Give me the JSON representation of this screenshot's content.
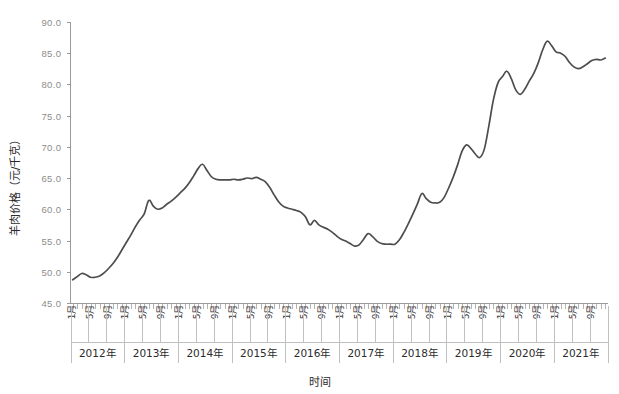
{
  "chart_data": {
    "type": "line",
    "title": "",
    "xlabel": "时间",
    "ylabel": "羊肉价格（元/千克）",
    "ylim": [
      45.0,
      90.0
    ],
    "ytick_step": 5.0,
    "ytick_labels": [
      "45.0",
      "50.0",
      "55.0",
      "60.0",
      "65.0",
      "70.0",
      "75.0",
      "80.0",
      "85.0",
      "90.0"
    ],
    "ytick_values": [
      45.0,
      50.0,
      55.0,
      60.0,
      65.0,
      70.0,
      75.0,
      80.0,
      85.0,
      90.0
    ],
    "grid": false,
    "legend": "none",
    "line_color": "#4d4d4d",
    "axis_color": "#9a9a9a",
    "month_tick_labels": [
      "1月",
      "5月",
      "9月"
    ],
    "year_groups": [
      "2012年",
      "2013年",
      "2014年",
      "2015年",
      "2016年",
      "2017年",
      "2018年",
      "2019年",
      "2020年",
      "2021年"
    ],
    "x_unit": "月",
    "n_points": 120,
    "x_start": "2012年1月",
    "x_end": "2021年12月",
    "series": [
      {
        "name": "羊肉价格",
        "unit": "元/千克",
        "values": [
          48.8,
          49.3,
          49.8,
          49.6,
          49.2,
          49.2,
          49.4,
          49.9,
          50.6,
          51.4,
          52.4,
          53.6,
          54.8,
          56.0,
          57.3,
          58.4,
          59.4,
          61.5,
          60.6,
          60.1,
          60.3,
          60.9,
          61.4,
          62.0,
          62.7,
          63.4,
          64.3,
          65.4,
          66.6,
          67.3,
          66.3,
          65.3,
          64.9,
          64.8,
          64.8,
          64.8,
          64.9,
          64.8,
          64.9,
          65.1,
          65.0,
          65.2,
          64.9,
          64.5,
          63.6,
          62.4,
          61.3,
          60.6,
          60.3,
          60.1,
          59.9,
          59.6,
          58.9,
          57.6,
          58.3,
          57.6,
          57.2,
          56.9,
          56.4,
          55.8,
          55.3,
          55.0,
          54.6,
          54.2,
          54.4,
          55.3,
          56.2,
          55.7,
          55.0,
          54.6,
          54.5,
          54.5,
          54.5,
          55.2,
          56.4,
          57.8,
          59.3,
          60.9,
          62.6,
          61.8,
          61.2,
          61.1,
          61.2,
          62.0,
          63.5,
          65.2,
          67.2,
          69.4,
          70.4,
          69.8,
          68.9,
          68.4,
          69.8,
          73.5,
          77.6,
          80.3,
          81.3,
          82.2,
          81.0,
          79.2,
          78.5,
          79.3,
          80.6,
          81.8,
          83.5,
          85.6,
          87.0,
          86.3,
          85.3,
          85.1,
          84.6,
          83.6,
          82.9,
          82.6,
          82.9,
          83.4,
          83.9,
          84.1,
          84.0,
          84.3
        ]
      }
    ]
  },
  "axes": {
    "y_title": "羊肉价格（元/千克）",
    "x_title": "时间"
  }
}
